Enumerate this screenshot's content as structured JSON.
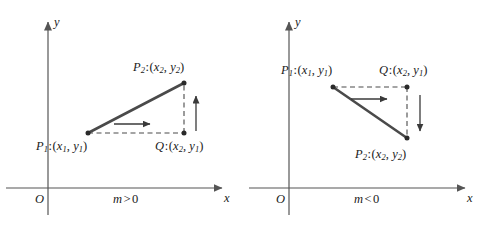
{
  "figure": {
    "width": 485,
    "height": 230,
    "background": "#ffffff",
    "stroke_color": "#3a3a3a",
    "axis_color": "#555555",
    "text_color": "#1a1a1a"
  },
  "panels": [
    {
      "id": "left",
      "caption": {
        "m": "m",
        "op": ">",
        "value": "0"
      },
      "caption_text": "m > 0",
      "axes": {
        "x_label": "x",
        "y_label": "y",
        "origin_label": "O",
        "origin_px": {
          "x": 48,
          "y": 188
        },
        "x_axis": {
          "x1": 6,
          "y1": 188,
          "x2": 228,
          "y2": 188
        },
        "y_axis": {
          "x1": 48,
          "y1": 215,
          "x2": 48,
          "y2": 16
        }
      },
      "points": [
        {
          "name": "P1",
          "label_base": "P",
          "label_sub": "1",
          "coord_x_base": "x",
          "coord_x_sub": "1",
          "coord_y_base": "y",
          "coord_y_sub": "1",
          "px": {
            "x": 88,
            "y": 133
          },
          "label_px": {
            "x": 36,
            "y": 140
          }
        },
        {
          "name": "P2",
          "label_base": "P",
          "label_sub": "2",
          "coord_x_base": "x",
          "coord_x_sub": "2",
          "coord_y_base": "y",
          "coord_y_sub": "2",
          "px": {
            "x": 184,
            "y": 83
          },
          "label_px": {
            "x": 133,
            "y": 61
          }
        },
        {
          "name": "Q",
          "label_base": "Q",
          "label_sub": "",
          "coord_x_base": "x",
          "coord_x_sub": "2",
          "coord_y_base": "y",
          "coord_y_sub": "1",
          "px": {
            "x": 184,
            "y": 133
          },
          "label_px": {
            "x": 155,
            "y": 140
          }
        }
      ],
      "segment": {
        "from": "P1",
        "to": "P2"
      },
      "dashed_horizontal": {
        "x1": 88,
        "y1": 133,
        "x2": 184,
        "y2": 133
      },
      "dashed_vertical": {
        "x1": 184,
        "y1": 133,
        "x2": 184,
        "y2": 83
      },
      "run_arrow": {
        "direction": "right",
        "x1": 114,
        "y1": 124,
        "x2": 152,
        "y2": 124
      },
      "rise_arrow": {
        "direction": "up",
        "x1": 196,
        "y1": 131,
        "x2": 196,
        "y2": 94
      }
    },
    {
      "id": "right",
      "caption": {
        "m": "m",
        "op": "<",
        "value": "0"
      },
      "caption_text": "m < 0",
      "axes": {
        "x_label": "x",
        "y_label": "y",
        "origin_label": "O",
        "origin_px": {
          "x": 46,
          "y": 188
        },
        "x_axis": {
          "x1": 6,
          "y1": 188,
          "x2": 228,
          "y2": 188
        },
        "y_axis": {
          "x1": 46,
          "y1": 215,
          "x2": 46,
          "y2": 16
        }
      },
      "points": [
        {
          "name": "P1",
          "label_base": "P",
          "label_sub": "1",
          "coord_x_base": "x",
          "coord_x_sub": "1",
          "coord_y_base": "y",
          "coord_y_sub": "1",
          "px": {
            "x": 90,
            "y": 87
          },
          "label_px": {
            "x": 38,
            "y": 64
          }
        },
        {
          "name": "Q",
          "label_base": "Q",
          "label_sub": "",
          "coord_x_base": "x",
          "coord_x_sub": "2",
          "coord_y_base": "y",
          "coord_y_sub": "1",
          "px": {
            "x": 164,
            "y": 87
          },
          "label_px": {
            "x": 136,
            "y": 64
          }
        },
        {
          "name": "P2",
          "label_base": "P",
          "label_sub": "2",
          "coord_x_base": "x",
          "coord_x_sub": "2",
          "coord_y_base": "y",
          "coord_y_sub": "2",
          "px": {
            "x": 164,
            "y": 138
          },
          "label_px": {
            "x": 112,
            "y": 148
          }
        }
      ],
      "segment": {
        "from": "P1",
        "to": "P2"
      },
      "dashed_horizontal": {
        "x1": 90,
        "y1": 87,
        "x2": 164,
        "y2": 87
      },
      "dashed_vertical": {
        "x1": 164,
        "y1": 87,
        "x2": 164,
        "y2": 138
      },
      "run_arrow": {
        "direction": "right",
        "x1": 108,
        "y1": 99,
        "x2": 146,
        "y2": 99
      },
      "rise_arrow": {
        "direction": "down",
        "x1": 177,
        "y1": 95,
        "x2": 177,
        "y2": 133
      }
    }
  ]
}
